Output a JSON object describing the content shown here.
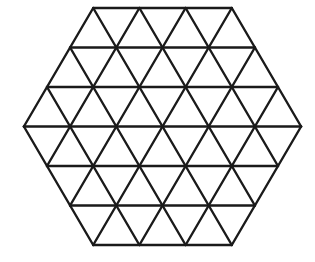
{
  "diagram": {
    "type": "triangular-grid-hexagon",
    "side_triangles": 3,
    "center": [
      162.5,
      126.5
    ],
    "unit": 46.2,
    "row_height": 39.5,
    "stroke_color": "#1a1a1a",
    "background_color": "#ffffff",
    "total_small_triangles": 54
  }
}
